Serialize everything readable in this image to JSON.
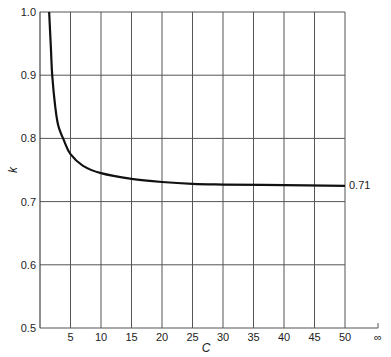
{
  "chart_data": {
    "type": "line",
    "title": "",
    "xlabel": "C",
    "ylabel": "k",
    "xlim": [
      0,
      50
    ],
    "ylim": [
      0.5,
      1.0
    ],
    "x_ticks": [
      "5",
      "10",
      "15",
      "20",
      "25",
      "30",
      "35",
      "40",
      "45",
      "50",
      "∞"
    ],
    "y_ticks": [
      "0.5",
      "0.6",
      "0.7",
      "0.8",
      "0.9",
      "1.0"
    ],
    "grid": true,
    "legend": null,
    "annotations": [
      {
        "text": "0.71",
        "at": "right end of curve"
      }
    ],
    "series": [
      {
        "name": "k vs C",
        "x": [
          1.5,
          1.8,
          2,
          2.5,
          3,
          4,
          5,
          7,
          10,
          15,
          20,
          25,
          30,
          40,
          50
        ],
        "y": [
          1.0,
          0.94,
          0.9,
          0.85,
          0.82,
          0.795,
          0.775,
          0.757,
          0.745,
          0.736,
          0.731,
          0.728,
          0.727,
          0.726,
          0.725
        ]
      }
    ]
  }
}
